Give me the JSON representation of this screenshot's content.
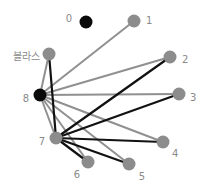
{
  "diagram": {
    "type": "network-graph",
    "colors": {
      "gray_node": "#8c8c8c",
      "black_node": "#0a0a0a",
      "gray_edge": "#909090",
      "black_edge": "#111111",
      "label": "#8a8a8a"
    },
    "nodes": [
      {
        "id": "0",
        "label": "0",
        "x": 86,
        "y": 22,
        "color": "black",
        "lx": 72,
        "ly": 19,
        "anchor": "end"
      },
      {
        "id": "1",
        "label": "1",
        "x": 134,
        "y": 21,
        "color": "gray",
        "lx": 146,
        "ly": 21,
        "anchor": "start"
      },
      {
        "id": "blas",
        "label": "블라스",
        "x": 49,
        "y": 54,
        "color": "gray",
        "lx": 40,
        "ly": 57,
        "anchor": "end"
      },
      {
        "id": "2",
        "label": "2",
        "x": 170,
        "y": 57,
        "color": "gray",
        "lx": 182,
        "ly": 60,
        "anchor": "start"
      },
      {
        "id": "8",
        "label": "8",
        "x": 40,
        "y": 95,
        "color": "black",
        "lx": 29,
        "ly": 99,
        "anchor": "end"
      },
      {
        "id": "3",
        "label": "3",
        "x": 179,
        "y": 94,
        "color": "gray",
        "lx": 190,
        "ly": 98,
        "anchor": "start"
      },
      {
        "id": "7",
        "label": "7",
        "x": 56,
        "y": 138,
        "color": "gray",
        "lx": 45,
        "ly": 142,
        "anchor": "end"
      },
      {
        "id": "4",
        "label": "4",
        "x": 163,
        "y": 142,
        "color": "gray",
        "lx": 172,
        "ly": 154,
        "anchor": "start"
      },
      {
        "id": "6",
        "label": "6",
        "x": 88,
        "y": 162,
        "color": "gray",
        "lx": 77,
        "ly": 175,
        "anchor": "middle"
      },
      {
        "id": "5",
        "label": "5",
        "x": 129,
        "y": 164,
        "color": "gray",
        "lx": 142,
        "ly": 177,
        "anchor": "middle"
      }
    ],
    "edges": [
      {
        "from": "8",
        "to": "1",
        "color": "gray"
      },
      {
        "from": "8",
        "to": "blas",
        "color": "gray"
      },
      {
        "from": "8",
        "to": "2",
        "color": "gray"
      },
      {
        "from": "8",
        "to": "3",
        "color": "gray"
      },
      {
        "from": "8",
        "to": "4",
        "color": "gray"
      },
      {
        "from": "8",
        "to": "5",
        "color": "gray"
      },
      {
        "from": "8",
        "to": "6",
        "color": "gray"
      },
      {
        "from": "8",
        "to": "7",
        "color": "gray"
      },
      {
        "from": "7",
        "to": "blas",
        "color": "black"
      },
      {
        "from": "7",
        "to": "2",
        "color": "black"
      },
      {
        "from": "7",
        "to": "3",
        "color": "black"
      },
      {
        "from": "7",
        "to": "4",
        "color": "black"
      },
      {
        "from": "7",
        "to": "5",
        "color": "black"
      },
      {
        "from": "7",
        "to": "6",
        "color": "black"
      }
    ]
  }
}
